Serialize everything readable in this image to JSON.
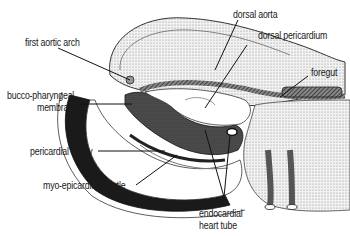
{
  "figure": {
    "labels": {
      "first_aortic_arch": "first aortic arch",
      "dorsal_aorta": "dorsal aorta",
      "dorsal_pericardium": "dorsal pericardium",
      "foregut": "foregut",
      "bucco_pharyngeal_line1": "bucco-pharyngeal",
      "bucco_pharyngeal_line2": "membrane",
      "pericardial_cavity": "pericardial cavity",
      "myo_epicardial_mantle": "myo-epicardial mantle",
      "endocardial_line1": "endocardial",
      "endocardial_line2": "heart tube"
    }
  }
}
